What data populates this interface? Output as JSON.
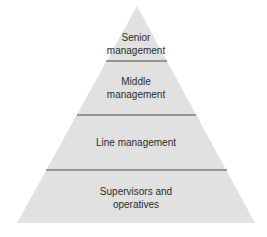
{
  "diagram": {
    "type": "pyramid",
    "colors": {
      "fill": "#e1e1e1",
      "divider": "#4a4a4a",
      "text": "#2b2b2b"
    },
    "levels": [
      {
        "lines": [
          "Senior",
          "management"
        ]
      },
      {
        "lines": [
          "Middle",
          "management"
        ]
      },
      {
        "lines": [
          "Line management"
        ]
      },
      {
        "lines": [
          "Supervisors and",
          "operatives"
        ]
      }
    ]
  }
}
